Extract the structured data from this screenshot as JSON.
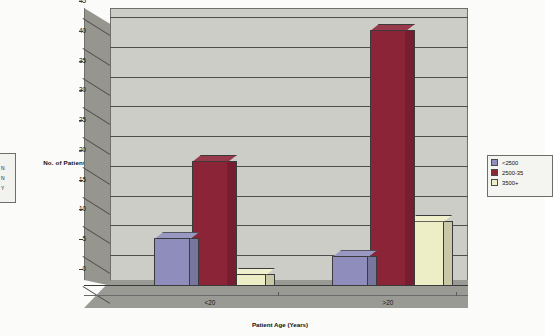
{
  "chart_data": {
    "type": "bar",
    "title": "",
    "categories": [
      "<20",
      ">20"
    ],
    "series": [
      {
        "name": "<2500",
        "color": "#8e8dbc",
        "values": [
          8,
          5
        ]
      },
      {
        "name": "2500-35",
        "color": "#8c2438",
        "values": [
          21,
          43
        ]
      },
      {
        "name": "3500+",
        "color": "#eeeec6",
        "values": [
          2,
          11
        ]
      }
    ],
    "xlabel": "Patient Age (Years)",
    "ylabel": "No. of Patients",
    "ylim": [
      0,
      45
    ],
    "yticks": [
      "0",
      "5",
      "10",
      "15",
      "20",
      "25",
      "30",
      "35",
      "40",
      "45"
    ],
    "grid": true,
    "legend_position": "right",
    "style_3d": true
  },
  "legend_right": {
    "items": [
      {
        "label": "<2500",
        "color": "#8e8dbc"
      },
      {
        "label": "2500-35",
        "color": "#8c2438"
      },
      {
        "label": "3500+",
        "color": "#eeeec6"
      }
    ]
  },
  "legend_left_partial": {
    "items": [
      {
        "label": "N",
        "color": "#8e8dbc"
      },
      {
        "label": "N",
        "color": "#8c2438"
      },
      {
        "label": "Y",
        "color": "#eeeec6"
      }
    ]
  },
  "colors": {
    "plot_back_wall": "#cdcdc8",
    "plot_side_wall": "#96968f",
    "plot_floor": "#9a9a94",
    "gridline": "#4e4e4c",
    "text": "#111111"
  }
}
